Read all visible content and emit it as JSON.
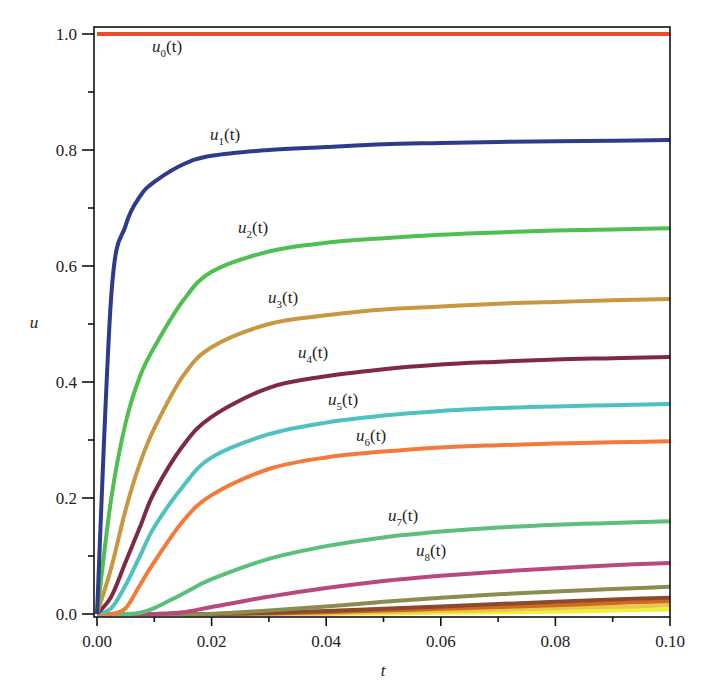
{
  "chart_data": {
    "type": "line",
    "title": "",
    "xlabel": "t",
    "ylabel": "u",
    "xlim": [
      0.0,
      0.1
    ],
    "ylim": [
      0.0,
      1.0
    ],
    "grid": false,
    "legend_position": "inline labels",
    "x_ticks": [
      "0.00",
      "0.02",
      "0.04",
      "0.06",
      "0.08",
      "0.10"
    ],
    "y_ticks": [
      "0.0",
      "0.2",
      "0.4",
      "0.6",
      "0.8",
      "1.0"
    ],
    "x": [
      0.0,
      0.0025,
      0.005,
      0.0075,
      0.01,
      0.015,
      0.02,
      0.03,
      0.04,
      0.05,
      0.06,
      0.07,
      0.08,
      0.09,
      0.1
    ],
    "series": [
      {
        "name": "u0(t)",
        "label": "u",
        "sub": "0",
        "color": "#ee4b2b",
        "label_pos": [
          152,
          52
        ],
        "values": [
          1.0,
          1.0,
          1.0,
          1.0,
          1.0,
          1.0,
          1.0,
          1.0,
          1.0,
          1.0,
          1.0,
          1.0,
          1.0,
          1.0,
          1.0
        ]
      },
      {
        "name": "u1(t)",
        "label": "u",
        "sub": "1",
        "color": "#2e3a8c",
        "label_pos": [
          210,
          140
        ],
        "values": [
          0.0,
          0.55,
          0.67,
          0.72,
          0.745,
          0.775,
          0.79,
          0.8,
          0.805,
          0.81,
          0.812,
          0.814,
          0.815,
          0.816,
          0.817
        ]
      },
      {
        "name": "u2(t)",
        "label": "u",
        "sub": "2",
        "color": "#4fbf4f",
        "label_pos": [
          238,
          233
        ],
        "values": [
          0.0,
          0.2,
          0.33,
          0.41,
          0.46,
          0.54,
          0.59,
          0.625,
          0.64,
          0.648,
          0.654,
          0.658,
          0.661,
          0.663,
          0.665
        ]
      },
      {
        "name": "u3(t)",
        "label": "u",
        "sub": "3",
        "color": "#c8973f",
        "label_pos": [
          268,
          303
        ],
        "values": [
          0.0,
          0.08,
          0.18,
          0.26,
          0.32,
          0.41,
          0.46,
          0.5,
          0.515,
          0.525,
          0.53,
          0.535,
          0.538,
          0.541,
          0.543
        ]
      },
      {
        "name": "u4(t)",
        "label": "u",
        "sub": "4",
        "color": "#7e2a45",
        "label_pos": [
          298,
          358
        ],
        "values": [
          0.0,
          0.03,
          0.09,
          0.15,
          0.21,
          0.29,
          0.34,
          0.39,
          0.41,
          0.422,
          0.43,
          0.435,
          0.439,
          0.441,
          0.443
        ]
      },
      {
        "name": "u5(t)",
        "label": "u",
        "sub": "5",
        "color": "#4fc1c1",
        "label_pos": [
          328,
          405
        ],
        "values": [
          0.0,
          0.01,
          0.05,
          0.1,
          0.15,
          0.22,
          0.27,
          0.31,
          0.33,
          0.342,
          0.35,
          0.355,
          0.358,
          0.36,
          0.362
        ]
      },
      {
        "name": "u6(t)",
        "label": "u",
        "sub": "6",
        "color": "#f47a3a",
        "label_pos": [
          356,
          441
        ],
        "values": [
          0.0,
          0.0,
          0.01,
          0.05,
          0.09,
          0.16,
          0.205,
          0.25,
          0.27,
          0.28,
          0.287,
          0.291,
          0.294,
          0.296,
          0.298
        ]
      },
      {
        "name": "u7(t)",
        "label": "u",
        "sub": "7",
        "color": "#5cbf7d",
        "label_pos": [
          388,
          521
        ],
        "values": [
          0.0,
          0.0,
          0.0,
          0.002,
          0.01,
          0.035,
          0.06,
          0.095,
          0.117,
          0.132,
          0.142,
          0.149,
          0.154,
          0.157,
          0.16
        ]
      },
      {
        "name": "u8(t)",
        "label": "u",
        "sub": "8",
        "color": "#b8487e",
        "label_pos": [
          416,
          556
        ],
        "values": [
          0.0,
          0.0,
          0.0,
          0.0,
          0.0,
          0.003,
          0.012,
          0.03,
          0.045,
          0.057,
          0.066,
          0.073,
          0.079,
          0.084,
          0.088
        ]
      },
      {
        "name": "u9(t)",
        "label": "",
        "sub": "",
        "color": "#8c8c4f",
        "label_pos": null,
        "values": [
          0.0,
          0.0,
          0.0,
          0.0,
          0.0,
          0.0,
          0.0,
          0.006,
          0.013,
          0.021,
          0.028,
          0.034,
          0.039,
          0.043,
          0.047
        ]
      },
      {
        "name": "u10(t)",
        "label": "",
        "sub": "",
        "color": "#8b4a2b",
        "label_pos": null,
        "values": [
          0.0,
          0.0,
          0.0,
          0.0,
          0.0,
          0.0,
          0.0,
          0.002,
          0.005,
          0.009,
          0.013,
          0.017,
          0.021,
          0.025,
          0.028
        ]
      },
      {
        "name": "u11(t)",
        "label": "",
        "sub": "",
        "color": "#d2691e",
        "label_pos": null,
        "values": [
          0.0,
          0.0,
          0.0,
          0.0,
          0.0,
          0.0,
          0.0,
          0.001,
          0.003,
          0.006,
          0.009,
          0.012,
          0.015,
          0.019,
          0.022
        ]
      },
      {
        "name": "u12(t)",
        "label": "",
        "sub": "",
        "color": "#e8c84a",
        "label_pos": null,
        "values": [
          0.0,
          0.0,
          0.0,
          0.0,
          0.0,
          0.0,
          0.0,
          0.0,
          0.001,
          0.003,
          0.005,
          0.007,
          0.01,
          0.012,
          0.015
        ]
      },
      {
        "name": "u13(t)",
        "label": "",
        "sub": "",
        "color": "#f2ef3a",
        "label_pos": null,
        "values": [
          0.0,
          0.0,
          0.0,
          0.0,
          0.0,
          0.0,
          0.0,
          0.0,
          0.0,
          0.001,
          0.002,
          0.003,
          0.004,
          0.006,
          0.008
        ]
      }
    ]
  },
  "layout": {
    "plot_left": 97,
    "plot_right": 670,
    "plot_top": 27,
    "plot_bottom": 617,
    "y0_px": 614,
    "y1_px": 34
  }
}
